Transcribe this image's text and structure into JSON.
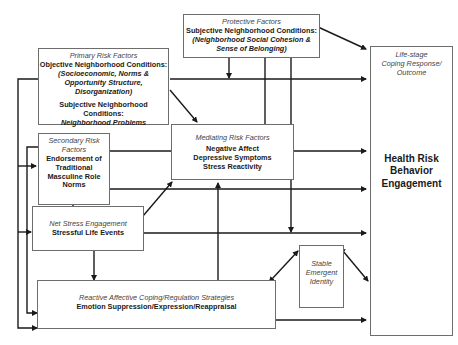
{
  "diagram": {
    "protective": {
      "heading": "Protective Factors",
      "line1": "Subjective Neighborhood Conditions:",
      "line2": "(Neighborhood Social Cohesion &",
      "line3": "Sense of Belonging)"
    },
    "primary": {
      "heading": "Primary Risk Factors",
      "line1": "Objective Neighborhood Conditions:",
      "line2": "(Socioeconomic, Norms &",
      "line3": "Opportunity Structure,",
      "line4": "Disorganization)",
      "line5": "Subjective Neighborhood Conditions:",
      "line6": "Neighborhood Problems"
    },
    "secondary": {
      "heading1": "Secondary Risk",
      "heading2": "Factors",
      "line1": "Endorsement of",
      "line2": "Traditional",
      "line3": "Masculine Role",
      "line4": "Norms"
    },
    "mediating": {
      "heading": "Mediating Risk Factors",
      "line1": "Negative Affect",
      "line2": "Depressive Symptoms",
      "line3": "Stress Reactivity"
    },
    "stress": {
      "heading": "Net Stress Engagement",
      "line1": "Stressful Life Events"
    },
    "coping": {
      "heading": "Reactive Affective Coping/Regulation Strategies",
      "line1": "Emotion Suppression/Expression/Reappraisal"
    },
    "identity": {
      "line1": "Stable",
      "line2": "Emergent",
      "line3": "Identity"
    },
    "outcome": {
      "heading1": "Life-stage",
      "heading2": "Coping Response/",
      "heading3": "Outcome",
      "line1": "Health Risk",
      "line2": "Behavior",
      "line3": "Engagement"
    }
  }
}
